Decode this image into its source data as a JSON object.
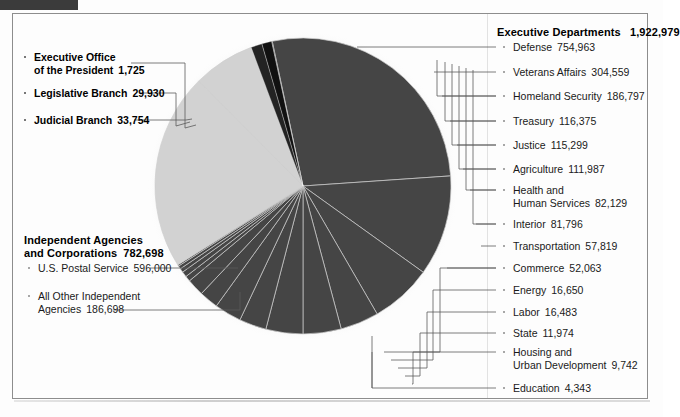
{
  "chart_data": {
    "type": "pie",
    "title": "",
    "total": 2771086,
    "units": "employees",
    "legend_position": "callout-labels",
    "grid": false,
    "groups": [
      {
        "name": "Executive Departments",
        "value": 1922979,
        "value_label": "1,922,979",
        "color": "#454545",
        "side": "right",
        "slices": [
          {
            "label": "Defense",
            "value": 754963,
            "value_label": "754,963"
          },
          {
            "label": "Veterans Affairs",
            "value": 304559,
            "value_label": "304,559"
          },
          {
            "label": "Homeland Security",
            "value": 186797,
            "value_label": "186,797"
          },
          {
            "label": "Treasury",
            "value": 116375,
            "value_label": "116,375"
          },
          {
            "label": "Justice",
            "value": 115299,
            "value_label": "115,299"
          },
          {
            "label": "Agriculture",
            "value": 111987,
            "value_label": "111,987"
          },
          {
            "label": "Health and Human Services",
            "value": 82129,
            "value_label": "82,129"
          },
          {
            "label": "Interior",
            "value": 81796,
            "value_label": "81,796"
          },
          {
            "label": "Transportation",
            "value": 57819,
            "value_label": "57,819"
          },
          {
            "label": "Commerce",
            "value": 52063,
            "value_label": "52,063"
          },
          {
            "label": "Energy",
            "value": 16650,
            "value_label": "16,650"
          },
          {
            "label": "Labor",
            "value": 16483,
            "value_label": "16,483"
          },
          {
            "label": "State",
            "value": 11974,
            "value_label": "11,974"
          },
          {
            "label": "Housing and Urban Development",
            "value": 9742,
            "value_label": "9,742"
          },
          {
            "label": "Education",
            "value": 4343,
            "value_label": "4,343"
          }
        ]
      },
      {
        "name": "Independent Agencies and Corporations",
        "value": 782698,
        "value_label": "782,698",
        "color": "#d2d2d2",
        "side": "left",
        "slices": [
          {
            "label": "U.S. Postal Service",
            "value": 596000,
            "value_label": "596,000"
          },
          {
            "label": "All Other Independent Agencies",
            "value": 186698,
            "value_label": "186,698"
          }
        ]
      },
      {
        "name": "Other Branches",
        "value": 65409,
        "value_label": "65,409",
        "color": "#1c1c1c",
        "side": "left",
        "slices": [
          {
            "label": "Executive Office of the President",
            "value": 1725,
            "value_label": "1,725"
          },
          {
            "label": "Legislative Branch",
            "value": 29930,
            "value_label": "29,930"
          },
          {
            "label": "Judicial Branch",
            "value": 33754,
            "value_label": "33,754"
          }
        ]
      }
    ]
  },
  "right_column": {
    "header": {
      "label": "Executive Departments",
      "value": "1,922,979"
    },
    "items": [
      {
        "label": "Defense",
        "value": "754,963",
        "y": 47,
        "two_line": false
      },
      {
        "label": "Veterans Affairs",
        "value": "304,559",
        "y": 72,
        "two_line": false
      },
      {
        "label": "Homeland Security",
        "value": "186,797",
        "y": 96,
        "two_line": false
      },
      {
        "label": "Treasury",
        "value": "116,375",
        "y": 121,
        "two_line": false
      },
      {
        "label": "Justice",
        "value": "115,299",
        "y": 145,
        "two_line": false
      },
      {
        "label": "Agriculture",
        "value": "111,987",
        "y": 169,
        "two_line": false
      },
      {
        "label": "Health and",
        "label2": "Human Services",
        "value": "82,129",
        "y": 190,
        "two_line": true
      },
      {
        "label": "Interior",
        "value": "81,796",
        "y": 224,
        "two_line": false
      },
      {
        "label": "Transportation",
        "value": "57,819",
        "y": 246,
        "two_line": false
      },
      {
        "label": "Commerce",
        "value": "52,063",
        "y": 268,
        "two_line": false
      },
      {
        "label": "Energy",
        "value": "16,650",
        "y": 290,
        "two_line": false
      },
      {
        "label": "Labor",
        "value": "16,483",
        "y": 312,
        "two_line": false
      },
      {
        "label": "State",
        "value": "11,974",
        "y": 333,
        "two_line": false
      },
      {
        "label": "Housing and",
        "label2": "Urban Development",
        "value": "9,742",
        "y": 352,
        "two_line": true
      },
      {
        "label": "Education",
        "value": "4,343",
        "y": 388,
        "two_line": false
      }
    ]
  },
  "left_column": {
    "branches": [
      {
        "label": "Executive Office",
        "label2": "of the President",
        "value": "1,725",
        "y": 57,
        "two_line": true
      },
      {
        "label": "Legislative Branch",
        "value": "29,930",
        "y": 93,
        "two_line": false
      },
      {
        "label": "Judicial Branch",
        "value": "33,754",
        "y": 120,
        "two_line": false
      }
    ],
    "independent": {
      "header_line1": "Independent Agencies",
      "header_line2": "and Corporations",
      "header_value": "782,698",
      "items": [
        {
          "label": "U.S. Postal Service",
          "value": "596,000",
          "y": 268,
          "two_line": false
        },
        {
          "label": "All Other Independent",
          "label2": "Agencies",
          "value": "186,698",
          "y": 296,
          "two_line": true
        }
      ]
    }
  }
}
